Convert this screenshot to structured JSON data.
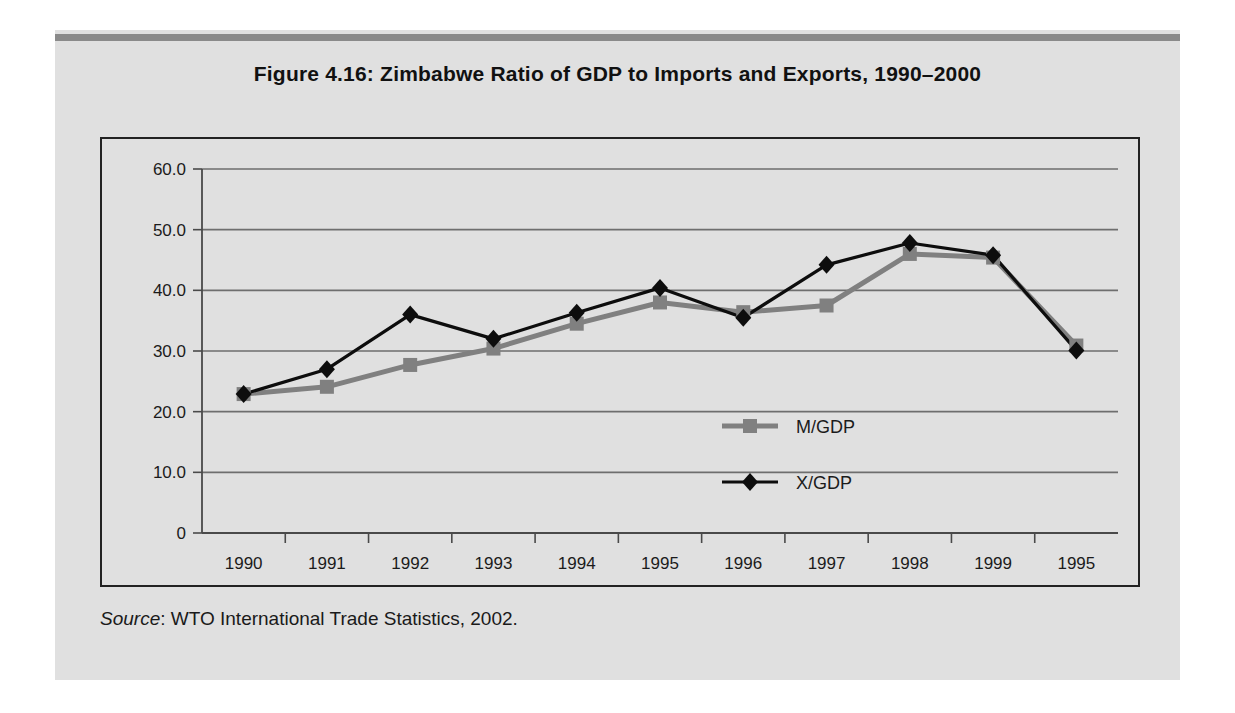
{
  "figure": {
    "title": "Figure 4.16:  Zimbabwe Ratio of GDP to Imports and Exports, 1990–2000",
    "source_label": "Source",
    "source_text": ":  WTO International Trade Statistics, 2002."
  },
  "colors": {
    "page_background": "#ffffff",
    "block_background": "#e0e0e0",
    "top_rule": "#8a8a8a",
    "plot_border": "#222222",
    "gridline": "#6e6e6e",
    "axis": "#4a4a4a",
    "series_m_gdp": "#808080",
    "series_x_gdp": "#0d0d0d",
    "text": "#1b1b1b"
  },
  "chart_data": {
    "type": "line",
    "title": "Figure 4.16:  Zimbabwe Ratio of GDP to Imports and Exports, 1990–2000",
    "xlabel": "",
    "ylabel": "",
    "categories": [
      "1990",
      "1991",
      "1992",
      "1993",
      "1994",
      "1995",
      "1996",
      "1997",
      "1998",
      "1999",
      "1995"
    ],
    "ylim": [
      0,
      60
    ],
    "yticks": [
      0,
      10,
      20,
      30,
      40,
      50,
      60
    ],
    "ytick_labels": [
      "0",
      "10.0",
      "20.0",
      "30.0",
      "40.0",
      "50.0",
      "60.0"
    ],
    "grid": true,
    "grid_axis": "y",
    "legend_position": "inside-center-right",
    "series": [
      {
        "name": "M/GDP",
        "marker": "square",
        "color": "#808080",
        "values": [
          22.9,
          24.1,
          27.7,
          30.4,
          34.5,
          38.0,
          36.4,
          37.5,
          46.0,
          45.4,
          30.9
        ]
      },
      {
        "name": "X/GDP",
        "marker": "diamond",
        "color": "#0d0d0d",
        "values": [
          22.9,
          27.0,
          36.0,
          32.0,
          36.3,
          40.4,
          35.5,
          44.2,
          47.8,
          45.8,
          30.1
        ]
      }
    ]
  },
  "legend": {
    "items": [
      {
        "label": "M/GDP",
        "marker": "square",
        "color": "#808080"
      },
      {
        "label": "X/GDP",
        "marker": "diamond",
        "color": "#0d0d0d"
      }
    ]
  }
}
